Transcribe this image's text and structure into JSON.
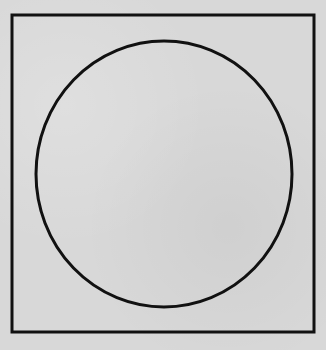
{
  "figure": {
    "background_color": "#d8d8d8",
    "stroke_color": "#111111",
    "frame": {
      "shape": "rectangle",
      "x": 12,
      "y": 15,
      "width": 302,
      "height": 317,
      "stroke_width": 3
    },
    "circle": {
      "shape": "ellipse",
      "cx": 164,
      "cy": 174,
      "rx": 128,
      "ry": 133,
      "stroke_width": 3
    }
  }
}
